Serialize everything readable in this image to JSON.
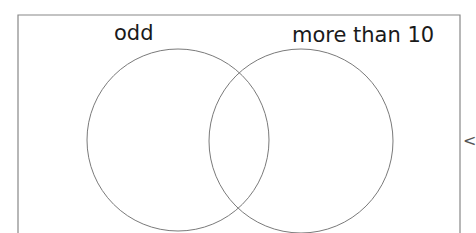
{
  "diagram": {
    "type": "venn",
    "sets": [
      {
        "id": "left",
        "label": "odd"
      },
      {
        "id": "right",
        "label": "more than 10"
      }
    ],
    "colors": {
      "frame": "#888888",
      "circle_stroke": "#7a7a7a",
      "text": "#1a1a1a",
      "background": "#ffffff"
    }
  },
  "side_control": {
    "icon": "chevron-left-icon",
    "glyph": "<"
  }
}
